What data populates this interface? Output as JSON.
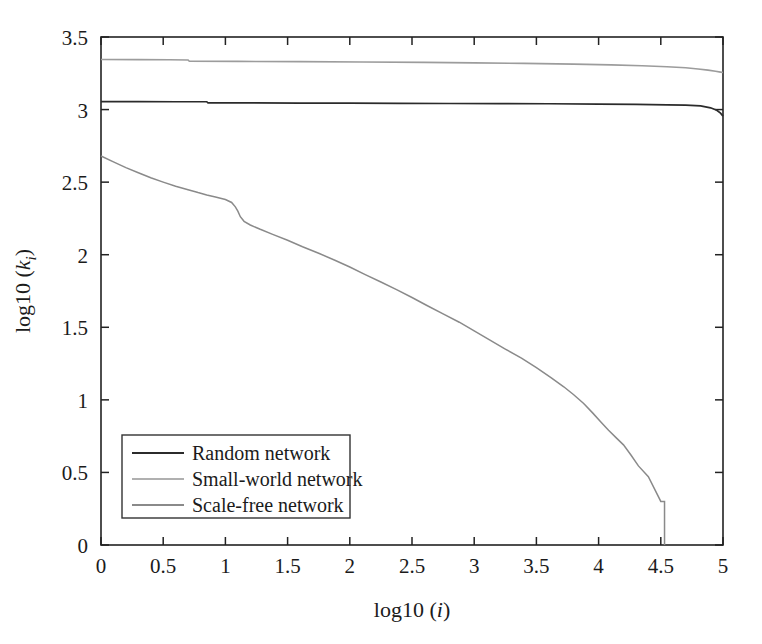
{
  "figure": {
    "background_color": "#ffffff",
    "width": 762,
    "height": 644
  },
  "chart_data": {
    "type": "line",
    "title": "",
    "subtitle": "",
    "xlabel": "log10 (i)",
    "xlabel_prefix": "log10 (",
    "xlabel_italic": "i",
    "xlabel_suffix": ")",
    "ylabel": "log10 (k_i)",
    "ylabel_prefix": "log10 (",
    "ylabel_italic": "k",
    "ylabel_subscript": "i",
    "ylabel_suffix": ")",
    "xlim": [
      0,
      5
    ],
    "ylim": [
      0,
      3.5
    ],
    "xticks": [
      0,
      0.5,
      1,
      1.5,
      2,
      2.5,
      3,
      3.5,
      4,
      4.5,
      5
    ],
    "yticks": [
      0,
      0.5,
      1,
      1.5,
      2,
      2.5,
      3,
      3.5
    ],
    "xticklabels": [
      "0",
      "0.5",
      "1",
      "1.5",
      "2",
      "2.5",
      "3",
      "3.5",
      "4",
      "4.5",
      "5"
    ],
    "yticklabels": [
      "0",
      "0.5",
      "1",
      "1.5",
      "2",
      "2.5",
      "3",
      "3.5"
    ],
    "grid": false,
    "tick_direction": "in",
    "legend_position": "lower left",
    "series": [
      {
        "name": "Random network",
        "color": "#2b2b2b",
        "linewidth": 1.7,
        "x": [
          0.0,
          0.3,
          0.6,
          0.85,
          0.86,
          1.2,
          1.6,
          2.0,
          2.4,
          2.8,
          3.2,
          3.6,
          4.0,
          4.3,
          4.55,
          4.7,
          4.82,
          4.9,
          4.95,
          4.98,
          5.0
        ],
        "y": [
          3.055,
          3.055,
          3.054,
          3.054,
          3.046,
          3.046,
          3.045,
          3.044,
          3.043,
          3.042,
          3.041,
          3.04,
          3.038,
          3.036,
          3.033,
          3.03,
          3.025,
          3.012,
          2.995,
          2.975,
          2.955
        ]
      },
      {
        "name": "Small-world network",
        "color": "#9c9c9c",
        "linewidth": 1.6,
        "x": [
          0.0,
          0.3,
          0.55,
          0.7,
          0.71,
          1.1,
          1.6,
          2.1,
          2.6,
          3.0,
          3.4,
          3.8,
          4.1,
          4.35,
          4.55,
          4.7,
          4.8,
          4.88,
          4.94,
          4.98,
          5.0
        ],
        "y": [
          3.345,
          3.344,
          3.343,
          3.342,
          3.333,
          3.332,
          3.33,
          3.328,
          3.325,
          3.322,
          3.318,
          3.313,
          3.308,
          3.302,
          3.295,
          3.288,
          3.28,
          3.272,
          3.264,
          3.258,
          3.255
        ]
      },
      {
        "name": "Scale-free network",
        "color": "#8a8a8a",
        "linewidth": 1.5,
        "x": [
          0.0,
          0.1,
          0.2,
          0.3,
          0.4,
          0.5,
          0.6,
          0.7,
          0.78,
          0.85,
          0.92,
          1.0,
          1.05,
          1.08,
          1.1,
          1.12,
          1.15,
          1.2,
          1.28,
          1.38,
          1.5,
          1.62,
          1.75,
          1.88,
          2.0,
          2.12,
          2.25,
          2.38,
          2.5,
          2.62,
          2.75,
          2.88,
          3.0,
          3.12,
          3.25,
          3.38,
          3.5,
          3.62,
          3.72,
          3.8,
          3.88,
          3.95,
          4.02,
          4.08,
          4.14,
          4.2,
          4.26,
          4.32,
          4.4,
          4.5,
          4.53,
          4.53
        ],
        "y": [
          2.68,
          2.64,
          2.6,
          2.565,
          2.53,
          2.5,
          2.472,
          2.448,
          2.428,
          2.412,
          2.398,
          2.38,
          2.36,
          2.33,
          2.3,
          2.262,
          2.23,
          2.205,
          2.175,
          2.14,
          2.1,
          2.055,
          2.01,
          1.962,
          1.915,
          1.865,
          1.812,
          1.758,
          1.705,
          1.65,
          1.592,
          1.535,
          1.475,
          1.415,
          1.35,
          1.288,
          1.222,
          1.152,
          1.09,
          1.035,
          0.975,
          0.912,
          0.845,
          0.79,
          0.74,
          0.69,
          0.62,
          0.545,
          0.47,
          0.3,
          0.3,
          0.0
        ]
      }
    ],
    "legend_entries": [
      {
        "label": "Random network",
        "color": "#2b2b2b"
      },
      {
        "label": "Small-world network",
        "color": "#b0b0b0"
      },
      {
        "label": "Scale-free network",
        "color": "#8a8a8a"
      }
    ]
  }
}
